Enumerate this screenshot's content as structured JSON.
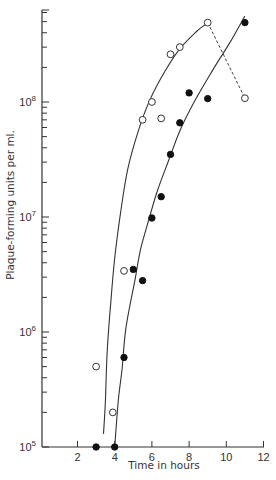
{
  "chart_data": {
    "type": "scatter",
    "title": "",
    "xlabel": "Time in hours",
    "ylabel": "Plaque-forming units per ml.",
    "xscale": "linear",
    "yscale": "log",
    "xlim": [
      0,
      12
    ],
    "ylim": [
      100000,
      600000000
    ],
    "x_ticks": [
      2,
      4,
      6,
      8,
      10,
      12
    ],
    "x_tick_labels": [
      "2",
      "4",
      "6",
      "8",
      "10",
      "12"
    ],
    "y_major_ticks": [
      100000,
      1000000,
      10000000,
      100000000
    ],
    "y_tick_labels": [
      {
        "base": "10",
        "exp": "5"
      },
      {
        "base": "10",
        "exp": "6"
      },
      {
        "base": "10",
        "exp": "7"
      },
      {
        "base": "10",
        "exp": "8"
      }
    ],
    "grid": false,
    "legend": null,
    "series": [
      {
        "name": "open circles",
        "marker": "open-circle",
        "points": [
          {
            "x": 3.0,
            "y": 500000
          },
          {
            "x": 3.9,
            "y": 200000
          },
          {
            "x": 4.5,
            "y": 3400000
          },
          {
            "x": 5.5,
            "y": 70000000
          },
          {
            "x": 6.0,
            "y": 100000000
          },
          {
            "x": 6.5,
            "y": 72000000
          },
          {
            "x": 7.0,
            "y": 260000000
          },
          {
            "x": 7.5,
            "y": 300000000
          },
          {
            "x": 9.0,
            "y": 490000000
          },
          {
            "x": 11.0,
            "y": 108000000
          }
        ]
      },
      {
        "name": "filled circles",
        "marker": "filled-circle",
        "points": [
          {
            "x": 3.0,
            "y": 100000
          },
          {
            "x": 4.0,
            "y": 100000
          },
          {
            "x": 4.5,
            "y": 600000
          },
          {
            "x": 5.0,
            "y": 3500000
          },
          {
            "x": 5.5,
            "y": 2800000
          },
          {
            "x": 6.0,
            "y": 9800000
          },
          {
            "x": 6.5,
            "y": 15000000
          },
          {
            "x": 7.0,
            "y": 35000000
          },
          {
            "x": 7.5,
            "y": 66000000
          },
          {
            "x": 8.0,
            "y": 120000000
          },
          {
            "x": 9.0,
            "y": 107000000
          },
          {
            "x": 11.0,
            "y": 490000000
          }
        ]
      }
    ],
    "fitted_curves": [
      {
        "name": "curve through open circles",
        "style": "solid",
        "points": [
          {
            "x": 3.4,
            "y": 130000
          },
          {
            "x": 3.5,
            "y": 250000
          },
          {
            "x": 3.6,
            "y": 700000
          },
          {
            "x": 3.8,
            "y": 1900000
          },
          {
            "x": 4.0,
            "y": 4400000
          },
          {
            "x": 4.3,
            "y": 10500000
          },
          {
            "x": 4.7,
            "y": 26000000
          },
          {
            "x": 5.3,
            "y": 58000000
          },
          {
            "x": 5.9,
            "y": 105000000
          },
          {
            "x": 6.7,
            "y": 185000000
          },
          {
            "x": 7.5,
            "y": 290000000
          },
          {
            "x": 8.4,
            "y": 410000000
          },
          {
            "x": 8.9,
            "y": 475000000
          }
        ]
      },
      {
        "name": "curve through filled circles",
        "style": "solid",
        "points": [
          {
            "x": 4.0,
            "y": 100000
          },
          {
            "x": 4.2,
            "y": 260000
          },
          {
            "x": 4.4,
            "y": 480000
          },
          {
            "x": 4.6,
            "y": 1080000
          },
          {
            "x": 5.1,
            "y": 2900000
          },
          {
            "x": 5.4,
            "y": 5300000
          },
          {
            "x": 5.9,
            "y": 10300000
          },
          {
            "x": 6.3,
            "y": 17000000
          },
          {
            "x": 6.9,
            "y": 31000000
          },
          {
            "x": 7.5,
            "y": 56000000
          },
          {
            "x": 8.3,
            "y": 102000000
          },
          {
            "x": 9.4,
            "y": 205000000
          },
          {
            "x": 10.2,
            "y": 330000000
          },
          {
            "x": 11.0,
            "y": 560000000
          }
        ]
      },
      {
        "name": "dashed connector",
        "style": "dashed",
        "points": [
          {
            "x": 9.0,
            "y": 490000000
          },
          {
            "x": 11.0,
            "y": 108000000
          }
        ]
      }
    ]
  }
}
